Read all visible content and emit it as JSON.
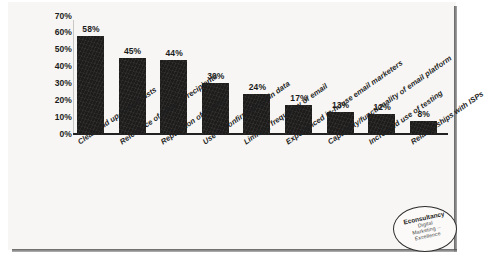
{
  "figure": {
    "background_color": "#f7f6f4",
    "bar_color": "#1d1c1b",
    "axis_color": "#222222"
  },
  "logo": {
    "name": "Econsultancy",
    "line1": "Econsultancy",
    "line2": "Digital",
    "line3": "Marketing --",
    "line4": "Excellence"
  },
  "chart_data": {
    "type": "bar",
    "title": "",
    "xlabel": "",
    "ylabel": "",
    "ylim": [
      0,
      70
    ],
    "grid": false,
    "legend": null,
    "ytick_labels": [
      "70%",
      "60%",
      "50%",
      "40%",
      "30%",
      "20%",
      "10%",
      "0%"
    ],
    "ytick_values": [
      70,
      60,
      50,
      40,
      30,
      20,
      10,
      0
    ],
    "categories": [
      "Clean and up-to-date lists",
      "Relevance of email to recipients",
      "Reputation of sender",
      "Use of confirmed opt-in data",
      "Limiting frequency of email",
      "Experienced in-house email marketers",
      "Capability/functionality of email platform",
      "Increased use of testing",
      "Relationships with ISPs"
    ],
    "values": [
      58,
      45,
      44,
      30,
      24,
      17,
      13,
      12,
      8
    ],
    "data_labels": [
      "58%",
      "45%",
      "44%",
      "30%",
      "24%",
      "17%",
      "13%",
      "12%",
      "8%"
    ]
  }
}
